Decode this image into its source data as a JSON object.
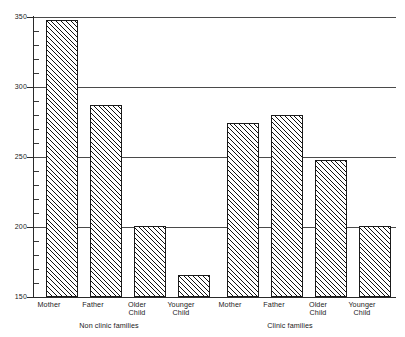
{
  "chart_data": {
    "type": "bar",
    "title": "",
    "subtitle": "",
    "xlabel": "",
    "ylabel": "",
    "ylim": [
      150,
      350
    ],
    "xlim": [
      0,
      8
    ],
    "grid": true,
    "grid_axis": "y",
    "legend": "none",
    "y_ticks_major": [
      150,
      200,
      250,
      300,
      350
    ],
    "y_tick_labels": [
      "150",
      "200",
      "250",
      "300",
      "350"
    ],
    "y_tick_minor_step": 10,
    "bar_fill": "diagonal-hatch",
    "bar_edge_color": "#1a1a1a",
    "categories": [
      "Mother",
      "Father",
      "Older Child",
      "Younger Child",
      "Mother",
      "Father",
      "Older Child",
      "Younger Child"
    ],
    "category_lines": [
      [
        "Mother"
      ],
      [
        "Father"
      ],
      [
        "Older",
        "Child"
      ],
      [
        "Younger",
        "Child"
      ],
      [
        "Mother"
      ],
      [
        "Father"
      ],
      [
        "Older",
        "Child"
      ],
      [
        "Younger",
        "Child"
      ]
    ],
    "values": [
      348,
      287,
      201,
      166,
      274,
      280,
      248,
      201
    ],
    "groups": [
      {
        "label": "Non clinic families",
        "categories": [
          "Mother",
          "Father",
          "Older Child",
          "Younger Child"
        ],
        "values": [
          348,
          287,
          201,
          166
        ]
      },
      {
        "label": "Clinic families",
        "categories": [
          "Mother",
          "Father",
          "Older Child",
          "Younger Child"
        ],
        "values": [
          274,
          280,
          248,
          201
        ]
      }
    ]
  },
  "group_labels": {
    "left": "Non clinic families",
    "right": "Clinic families"
  }
}
